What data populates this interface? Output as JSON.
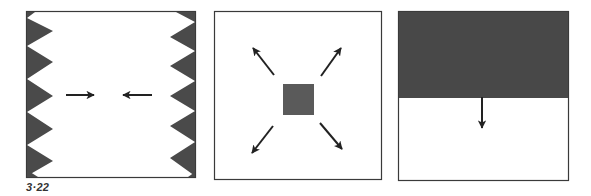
{
  "figure": {
    "label": "3·22",
    "colors": {
      "background": "#ffffff",
      "frame": "#3a3a3a",
      "teeth": "#4a4a4a",
      "square": "#5a5a5a",
      "dark_fill": "#484848",
      "arrow": "#222222"
    },
    "panels": [
      {
        "id": "panel-converging",
        "description": "Frame with sawtooth edges on left and right; two horizontal arrows pointing toward each other",
        "frame": {
          "x": 26,
          "y": 11,
          "w": 170,
          "h": 167
        },
        "arrows": [
          {
            "direction": "right",
            "from": [
              66,
              95
            ],
            "to": [
              94,
              95
            ]
          },
          {
            "direction": "left",
            "from": [
              152,
              95
            ],
            "to": [
              123,
              95
            ]
          }
        ]
      },
      {
        "id": "panel-expanding",
        "description": "Frame with a central grey square and four diagonal arrows pointing outward",
        "frame": {
          "x": 214,
          "y": 11,
          "w": 168,
          "h": 169
        },
        "square": {
          "x": 283,
          "y": 84,
          "w": 31,
          "h": 31
        },
        "arrows": [
          {
            "direction": "up-left",
            "from": [
              274,
              75
            ],
            "to": [
              253,
              48
            ]
          },
          {
            "direction": "up-right",
            "from": [
              321,
              76
            ],
            "to": [
              341,
              48
            ]
          },
          {
            "direction": "down-left",
            "from": [
              273,
              126
            ],
            "to": [
              252,
              153
            ]
          },
          {
            "direction": "down-right",
            "from": [
              320,
              123
            ],
            "to": [
              342,
              149
            ]
          }
        ]
      },
      {
        "id": "panel-descending",
        "description": "Frame with dark upper half and one arrow pointing downward from the boundary",
        "frame": {
          "x": 398,
          "y": 11,
          "w": 171,
          "h": 170
        },
        "dark_region_bottom": 98,
        "arrows": [
          {
            "direction": "down",
            "from": [
              482,
              97
            ],
            "to": [
              482,
              128
            ]
          }
        ]
      }
    ]
  }
}
